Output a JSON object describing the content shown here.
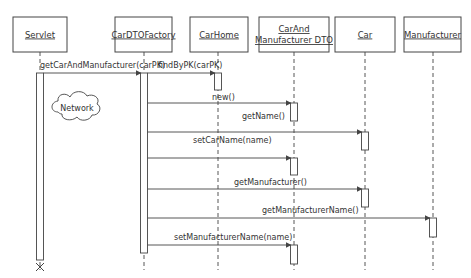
{
  "diagram": {
    "type": "sequence-diagram",
    "objects": [
      {
        "id": "servlet",
        "label": "Servlet",
        "lines": [
          "Servlet"
        ],
        "x": 13,
        "w": 54,
        "lifeline_x": 40
      },
      {
        "id": "factory",
        "label": "CarDTOFactory",
        "lines": [
          "CarDTOFactory"
        ],
        "x": 115,
        "w": 57,
        "lifeline_x": 144
      },
      {
        "id": "carhome",
        "label": "CarHome",
        "lines": [
          "CarHome"
        ],
        "x": 190,
        "w": 58,
        "lifeline_x": 218
      },
      {
        "id": "dto",
        "label": "CarAnd Manufacturer DTO",
        "lines": [
          "CarAnd",
          "Manufacturer DTO"
        ],
        "x": 259,
        "w": 70,
        "lifeline_x": 294
      },
      {
        "id": "car",
        "label": "Car",
        "lines": [
          "Car"
        ],
        "x": 335,
        "w": 60,
        "lifeline_x": 365
      },
      {
        "id": "manufacturer",
        "label": "Manufacturer",
        "lines": [
          "Manufacturer"
        ],
        "x": 404,
        "w": 57,
        "lifeline_x": 433
      }
    ],
    "messages": [
      {
        "label": "getCarAndManufacturer(carPK)",
        "from": "servlet",
        "to": "factory",
        "y": 73,
        "label_y": 68,
        "label_x": 40
      },
      {
        "label": "findByPK(carPK)",
        "from": "factory",
        "to": "carhome",
        "y": 73,
        "label_y": 68,
        "label_x": 158
      },
      {
        "label": "new()",
        "from": "factory",
        "to": "dto",
        "y": 103,
        "label_y": 100,
        "label_x": 212
      },
      {
        "label": "getName()",
        "from": "factory",
        "to": "car",
        "y": 132,
        "label_y": 119,
        "label_x": 242
      },
      {
        "label": "setCarName(name)",
        "from": "factory",
        "to": "dto",
        "y": 158,
        "label_y": 143,
        "label_x": 193
      },
      {
        "label": "getManufacturer()",
        "from": "factory",
        "to": "car",
        "y": 189,
        "label_y": 185,
        "label_x": 234
      },
      {
        "label": "getManufacturerName()",
        "from": "factory",
        "to": "manufacturer",
        "y": 218,
        "label_y": 213,
        "label_x": 262
      },
      {
        "label": "setManufacturerName(name)",
        "from": "factory",
        "to": "dto",
        "y": 245,
        "label_y": 240,
        "label_x": 174
      }
    ],
    "activations": [
      {
        "object": "servlet",
        "y1": 73,
        "y2": 260
      },
      {
        "object": "factory",
        "y1": 73,
        "y2": 253
      },
      {
        "object": "carhome",
        "y1": 73,
        "y2": 90
      },
      {
        "object": "dto",
        "y1": 103,
        "y2": 121
      },
      {
        "object": "car",
        "y1": 132,
        "y2": 150
      },
      {
        "object": "dto",
        "y1": 158,
        "y2": 175
      },
      {
        "object": "car",
        "y1": 189,
        "y2": 207
      },
      {
        "object": "manufacturer",
        "y1": 218,
        "y2": 237
      },
      {
        "object": "dto",
        "y1": 245,
        "y2": 264
      }
    ],
    "annotation": {
      "label": "Network",
      "shape": "cloud",
      "cx": 77,
      "cy": 108
    },
    "termination": {
      "object": "servlet",
      "symbol": "X",
      "y": 267
    },
    "colors": {
      "line": "#444444",
      "background": "#ffffff",
      "text": "#333333"
    }
  }
}
